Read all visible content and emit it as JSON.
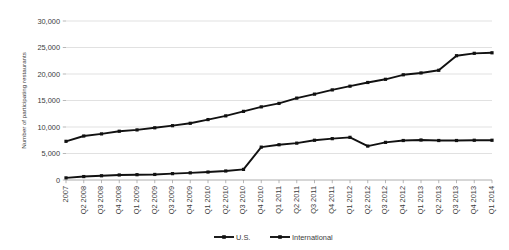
{
  "chart_data": {
    "type": "line",
    "title": "",
    "xlabel": "",
    "ylabel": "Number of participating restaurants",
    "ylim": [
      0,
      30000
    ],
    "ytick_labels": [
      "0",
      "5,000",
      "10,000",
      "15,000",
      "20,000",
      "25,000",
      "30,000"
    ],
    "ytick_values": [
      0,
      5000,
      10000,
      15000,
      20000,
      25000,
      30000
    ],
    "grid": true,
    "legend_position": "bottom",
    "categories": [
      "2007",
      "Q2 2008",
      "Q3 2008",
      "Q4 2008",
      "Q1 2009",
      "Q2 2009",
      "Q3 2009",
      "Q4 2009",
      "Q1 2010",
      "Q2 2010",
      "Q3 2010",
      "Q4 2010",
      "Q1 2011",
      "Q2 2011",
      "Q3 2011",
      "Q4 2011",
      "Q1 2012",
      "Q2 2012",
      "Q3 2012",
      "Q4 2012",
      "Q1 2013",
      "Q2 2013",
      "Q3 2013",
      "Q4 2013",
      "Q1 2014"
    ],
    "series": [
      {
        "name": "U.S.",
        "values": [
          400,
          650,
          800,
          950,
          1000,
          1050,
          1200,
          1350,
          1500,
          1700,
          2000,
          6200,
          6650,
          6950,
          7500,
          7800,
          8050,
          6400,
          7100,
          7450,
          7550,
          7450,
          7450,
          7500,
          7500
        ]
      },
      {
        "name": "International",
        "values": [
          7300,
          8300,
          8700,
          9200,
          9450,
          9850,
          10250,
          10700,
          11400,
          12100,
          12950,
          13800,
          14450,
          15450,
          16200,
          17000,
          17700,
          18400,
          19000,
          19850,
          20200,
          20700,
          23450,
          23900,
          24000
        ]
      }
    ],
    "legend": [
      {
        "label": "U.S."
      },
      {
        "label": "International"
      }
    ]
  },
  "colors": {
    "series": "#111111",
    "grid": "#d4d4d4",
    "axis": "#9a9a9a",
    "text": "#3b3b3b",
    "background": "#ffffff"
  }
}
